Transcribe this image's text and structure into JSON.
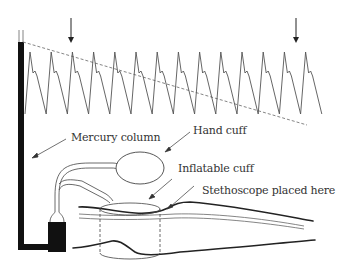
{
  "figure": {
    "type": "sphygmomanometer-auscultation-diagram",
    "colors": {
      "line": "#444444",
      "mercury": "#111111",
      "dashed": "#777777",
      "text": "#333333",
      "background": "#ffffff"
    }
  },
  "labels": {
    "mercury_column": "Mercury column",
    "hand_cuff": "Hand cuff",
    "inflatable_cuff": "Inflatable cuff",
    "stethoscope": "Stethoscope placed here"
  },
  "markers": [
    {
      "name": "systolic-arrow",
      "x": 71
    },
    {
      "name": "diastolic-arrow",
      "x": 296
    }
  ],
  "waveform": {
    "cycles": 14,
    "start_x": 25,
    "period_px": 21.2,
    "peak_y": 52,
    "trough_y": 114,
    "notch_y": 73
  },
  "cuff_pressure_line": {
    "style": "dashed",
    "from": [
      23,
      42
    ],
    "to": [
      307,
      125
    ]
  }
}
